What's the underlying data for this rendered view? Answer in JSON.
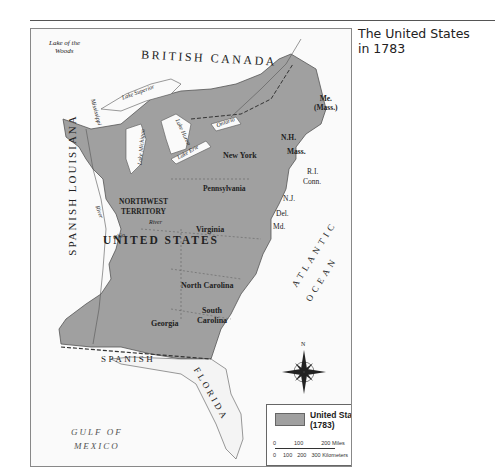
{
  "title": {
    "line1": "The United States",
    "line2": "in 1783"
  },
  "map": {
    "labels": {
      "lake_of_the_woods_1": "Lake of the",
      "lake_of_the_woods_2": "Woods",
      "british_canada": "BRITISH CANADA",
      "lake_superior": "Lake Superior",
      "lake_michigan": "Lake Michigan",
      "lake_huron": "Lake Huron",
      "lake_ontario": "Ontario",
      "lake_erie": "Lake Erie",
      "mississippi_river": "Mississippi",
      "river_left": "River",
      "ohio": "Ohio",
      "ohio_river": "River",
      "spanish_louisiana": "SPANISH LOUISIANA",
      "northwest_1": "NORTHWEST",
      "northwest_2": "TERRITORY",
      "united_states": "UNITED  STATES",
      "maine_1": "Me.",
      "maine_2": "(Mass.)",
      "nh": "N.H.",
      "mass": "Mass.",
      "ri": "R.I.",
      "conn": "Conn.",
      "new_york": "New York",
      "pennsylvania": "Pennsylvania",
      "nj": "N.J.",
      "del": "Del.",
      "md": "Md.",
      "virginia": "Virginia",
      "north_carolina": "North Carolina",
      "south_carolina_1": "South",
      "south_carolina_2": "Carolina",
      "georgia": "Georgia",
      "atlantic": "ATLANTIC",
      "ocean": "OCEAN",
      "spanish_florida_1": "SPANISH",
      "spanish_florida_2": "FLORIDA",
      "gulf_1": "GULF OF",
      "gulf_2": "MEXICO",
      "compass_n": "N"
    },
    "legend": {
      "item": "United States",
      "year": "(1783)",
      "miles": [
        "0",
        "100",
        "200 Miles"
      ],
      "km": [
        "0",
        "100",
        "200",
        "300 Kilometers"
      ]
    },
    "colors": {
      "us_fill": "#a0a0a0",
      "water": "#fafafa",
      "land_other": "#f4f4f4"
    }
  }
}
